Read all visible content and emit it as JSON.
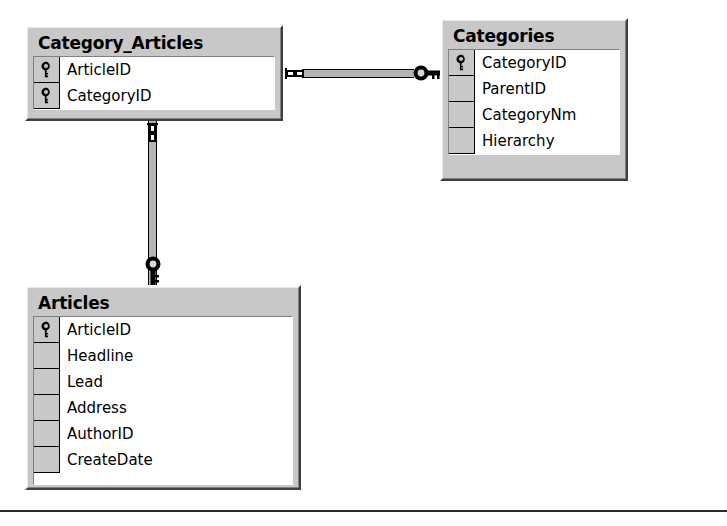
{
  "diagram": {
    "background_color": "#ffffff",
    "entity_fill_color": "#c8c8c8",
    "field_area_color": "#ffffff",
    "line_color": "#000000",
    "connector_fill_color": "#b4b4b4"
  },
  "entities": [
    {
      "name": "Category_Articles",
      "title": "Category_Articles",
      "fields": [
        {
          "label": "ArticleID",
          "primary_key": true,
          "icon": "key-icon"
        },
        {
          "label": "CategoryID",
          "primary_key": true,
          "icon": "key-icon"
        }
      ]
    },
    {
      "name": "Categories",
      "title": "Categories",
      "fields": [
        {
          "label": "CategoryID",
          "primary_key": true,
          "icon": "key-icon"
        },
        {
          "label": "ParentID",
          "primary_key": false,
          "icon": ""
        },
        {
          "label": "CategoryNm",
          "primary_key": false,
          "icon": ""
        },
        {
          "label": "Hierarchy",
          "primary_key": false,
          "icon": ""
        }
      ]
    },
    {
      "name": "Articles",
      "title": "Articles",
      "fields": [
        {
          "label": "ArticleID",
          "primary_key": true,
          "icon": "key-icon"
        },
        {
          "label": "Headline",
          "primary_key": false,
          "icon": ""
        },
        {
          "label": "Lead",
          "primary_key": false,
          "icon": ""
        },
        {
          "label": "Address",
          "primary_key": false,
          "icon": ""
        },
        {
          "label": "AuthorID",
          "primary_key": false,
          "icon": ""
        },
        {
          "label": "CreateDate",
          "primary_key": false,
          "icon": ""
        }
      ]
    }
  ],
  "relationships": [
    {
      "name": "category-articles-to-categories",
      "from_entity": "Category_Articles",
      "from_field": "CategoryID",
      "to_entity": "Categories",
      "to_field": "CategoryID",
      "from_cardinality": "many",
      "to_cardinality": "one",
      "from_marker": "infinity-icon",
      "to_marker": "key-icon",
      "orientation": "horizontal"
    },
    {
      "name": "category-articles-to-articles",
      "from_entity": "Category_Articles",
      "from_field": "ArticleID",
      "to_entity": "Articles",
      "to_field": "ArticleID",
      "from_cardinality": "many",
      "to_cardinality": "one",
      "from_marker": "infinity-icon",
      "to_marker": "key-icon",
      "orientation": "vertical"
    }
  ]
}
